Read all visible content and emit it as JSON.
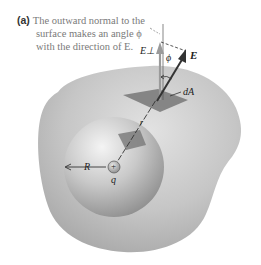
{
  "figure": {
    "panel_label": "(a)",
    "caption_lines": [
      "The outward normal to the",
      "surface makes an angle ϕ",
      "with the direction of E."
    ],
    "labels": {
      "E_perp": "E⊥",
      "phi": "ϕ",
      "E": "E",
      "dA": "dA",
      "r": "r",
      "R": "R",
      "q": "q",
      "charge_sign": "+"
    },
    "colors": {
      "outer_surface": "#bdbdbd",
      "inner_sphere": "#a8a8a8",
      "patch": "#7c7c7c",
      "normal_arrow": "#9a9a9a",
      "field_arrow": "#333333",
      "caption_text": "#7a7a7a"
    }
  }
}
